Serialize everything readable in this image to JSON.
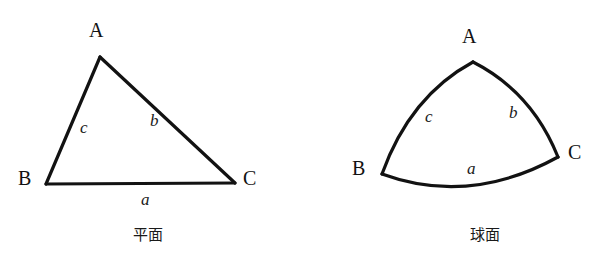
{
  "page": {
    "background_color": "#ffffff",
    "stroke_color": "#121212",
    "width": 594,
    "height": 279
  },
  "figures": [
    {
      "id": "plane-triangle",
      "caption": "平面",
      "shape": "straight-sided triangle",
      "vertices": [
        {
          "name": "A",
          "label": "A",
          "x": 100,
          "y": 57,
          "label_x": 89,
          "label_y": 20
        },
        {
          "name": "B",
          "label": "B",
          "x": 46,
          "y": 184,
          "label_x": 18,
          "label_y": 168
        },
        {
          "name": "C",
          "label": "C",
          "x": 235,
          "y": 183,
          "label_x": 243,
          "label_y": 168
        }
      ],
      "sides": [
        {
          "name": "a",
          "label": "a",
          "between": "B-C",
          "label_x": 141,
          "label_y": 191,
          "curved": false
        },
        {
          "name": "b",
          "label": "b",
          "between": "A-C",
          "label_x": 150,
          "label_y": 112,
          "curved": false
        },
        {
          "name": "c",
          "label": "c",
          "between": "A-B",
          "label_x": 80,
          "label_y": 119,
          "curved": false
        }
      ],
      "caption_x": 148,
      "caption_y": 228
    },
    {
      "id": "spherical-triangle",
      "caption": "球面",
      "shape": "triangle with outward-bowing arc sides",
      "vertices": [
        {
          "name": "A",
          "label": "A",
          "x": 176,
          "y": 62,
          "label_x": 165,
          "label_y": 26
        },
        {
          "name": "B",
          "label": "B",
          "x": 85,
          "y": 174,
          "label_x": 55,
          "label_y": 158
        },
        {
          "name": "C",
          "label": "C",
          "x": 261,
          "y": 157,
          "label_x": 271,
          "label_y": 142
        }
      ],
      "sides": [
        {
          "name": "a",
          "label": "a",
          "between": "B-C",
          "label_x": 170,
          "label_y": 160,
          "curved": true,
          "bow": "downward"
        },
        {
          "name": "b",
          "label": "b",
          "between": "A-C",
          "label_x": 212,
          "label_y": 104,
          "curved": true,
          "bow": "outward-right"
        },
        {
          "name": "c",
          "label": "c",
          "between": "A-B",
          "label_x": 128,
          "label_y": 108,
          "curved": true,
          "bow": "outward-left"
        }
      ],
      "caption_x": 188,
      "caption_y": 228
    }
  ]
}
